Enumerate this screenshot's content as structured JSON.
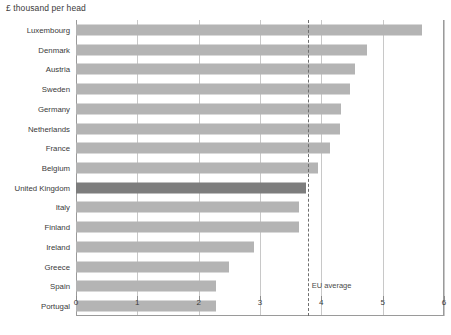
{
  "chart_data": {
    "type": "bar",
    "orientation": "horizontal",
    "title": "£ thousand per head",
    "xlabel": "",
    "ylabel": "",
    "xlim": [
      0,
      6
    ],
    "xticks": [
      0,
      1,
      2,
      3,
      4,
      5,
      6
    ],
    "xticklabels": [
      "0",
      "1",
      "2",
      "3",
      "4",
      "5",
      "6"
    ],
    "grid": true,
    "legend": false,
    "categories": [
      "Luxembourg",
      "Denmark",
      "Austria",
      "Sweden",
      "Germany",
      "Netherlands",
      "France",
      "Belgium",
      "United Kingdom",
      "Italy",
      "Finland",
      "Ireland",
      "Greece",
      "Spain",
      "Portugal"
    ],
    "values": [
      5.64,
      4.75,
      4.55,
      4.47,
      4.32,
      4.3,
      4.14,
      3.95,
      3.75,
      3.64,
      3.63,
      2.9,
      2.5,
      2.29,
      2.28
    ],
    "highlight_category": "United Kingdom",
    "annotations": [
      {
        "name": "eu-average",
        "label": "EU average",
        "value": 3.78,
        "style": "dashed-vertical-line"
      }
    ],
    "colors": {
      "bar": "#b4b4b4",
      "bar_highlight": "#7d7d7d",
      "gridline": "#c8c8c8",
      "axis": "#9a9a9a",
      "eu_line": "#6e6e6e",
      "text": "#3a3a3a"
    }
  }
}
